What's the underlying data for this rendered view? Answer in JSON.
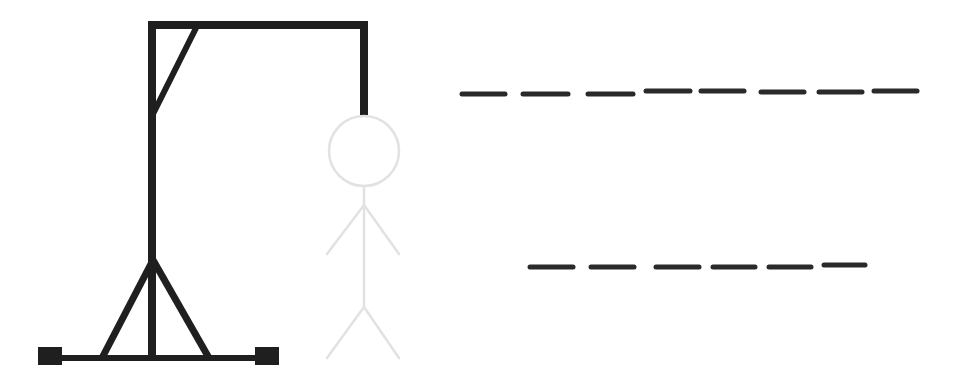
{
  "game": {
    "type": "hangman",
    "colors": {
      "gallows": "#1f1f1f",
      "figure": "#e2e2e2",
      "dash": "#2a2a2a",
      "background": "#ffffff"
    },
    "word_rows": [
      {
        "letter_count": 8,
        "slots": [
          {
            "x1": 462,
            "x2": 505,
            "y": 94
          },
          {
            "x1": 523,
            "x2": 568,
            "y": 94
          },
          {
            "x1": 588,
            "x2": 633,
            "y": 94
          },
          {
            "x1": 646,
            "x2": 690,
            "y": 91
          },
          {
            "x1": 701,
            "x2": 744,
            "y": 91
          },
          {
            "x1": 761,
            "x2": 804,
            "y": 92
          },
          {
            "x1": 819,
            "x2": 862,
            "y": 92
          },
          {
            "x1": 874,
            "x2": 917,
            "y": 91
          }
        ]
      },
      {
        "letter_count": 6,
        "slots": [
          {
            "x1": 530,
            "x2": 573,
            "y": 267
          },
          {
            "x1": 591,
            "x2": 634,
            "y": 267
          },
          {
            "x1": 656,
            "x2": 699,
            "y": 267
          },
          {
            "x1": 713,
            "x2": 755,
            "y": 267
          },
          {
            "x1": 769,
            "x2": 811,
            "y": 267
          },
          {
            "x1": 824,
            "x2": 865,
            "y": 265
          }
        ]
      }
    ],
    "figure_parts": [
      "head",
      "body",
      "left-arm",
      "right-arm",
      "left-leg",
      "right-leg"
    ]
  }
}
